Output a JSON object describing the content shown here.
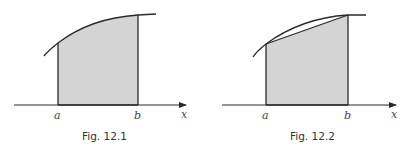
{
  "figures": [
    {
      "id": "fig1",
      "caption": "Fig. 12.1",
      "labels": {
        "a": "a",
        "b": "b",
        "axis": "x"
      },
      "description": "Shaded area under curve between a and b"
    },
    {
      "id": "fig2",
      "caption": "Fig. 12.2",
      "labels": {
        "a": "a",
        "b": "b",
        "axis": "x"
      },
      "description": "Trapezium approximation of area under curve between a and b"
    }
  ],
  "colors": {
    "fill": "#d4d4d4",
    "stroke": "#2a2a2a",
    "background": "#ffffff"
  }
}
